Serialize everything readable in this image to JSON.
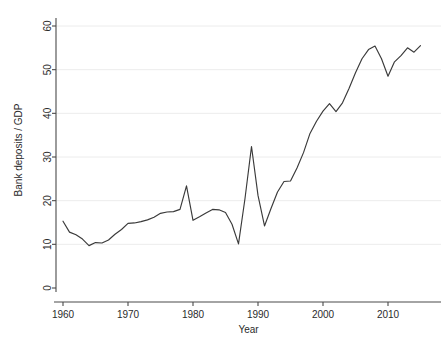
{
  "chart_data": {
    "type": "line",
    "title": "",
    "xlabel": "Year",
    "ylabel": "Bank deposits / GDP",
    "xlim": [
      1958.5,
      2016.5
    ],
    "ylim": [
      0,
      62
    ],
    "xticks": [
      1960,
      1970,
      1980,
      1990,
      2000,
      2010
    ],
    "yticks": [
      0,
      10,
      20,
      30,
      40,
      50,
      60
    ],
    "xticklabels": [
      "1960",
      "1970",
      "1980",
      "1990",
      "2000",
      "2010"
    ],
    "yticklabels": [
      "0",
      "10",
      "20",
      "30",
      "40",
      "50",
      "60"
    ],
    "grid": "horizontal",
    "legend": "none",
    "line_color": "#3a3a3a",
    "grid_color": "#ececec",
    "axis_color": "#4a4a4a",
    "series": [
      {
        "name": "Bank deposits / GDP",
        "x": [
          1960,
          1961,
          1962,
          1963,
          1964,
          1965,
          1966,
          1967,
          1968,
          1969,
          1970,
          1971,
          1972,
          1973,
          1974,
          1975,
          1976,
          1977,
          1978,
          1979,
          1980,
          1981,
          1982,
          1983,
          1984,
          1985,
          1986,
          1987,
          1988,
          1989,
          1990,
          1991,
          1992,
          1993,
          1994,
          1995,
          1996,
          1997,
          1998,
          1999,
          2000,
          2001,
          2002,
          2003,
          2004,
          2005,
          2006,
          2007,
          2008,
          2009,
          2010,
          2011,
          2012,
          2013,
          2014,
          2015
        ],
        "values": [
          15.3,
          12.8,
          12.2,
          11.2,
          9.7,
          10.4,
          10.3,
          11.0,
          12.3,
          13.4,
          14.8,
          14.9,
          15.2,
          15.6,
          16.2,
          17.1,
          17.4,
          17.5,
          18.0,
          23.4,
          15.5,
          16.3,
          17.2,
          18.0,
          17.9,
          17.3,
          14.6,
          10.1,
          20.5,
          32.4,
          21.2,
          14.2,
          18.2,
          22.0,
          24.4,
          24.5,
          27.5,
          31.0,
          35.4,
          38.2,
          40.5,
          42.2,
          40.4,
          42.4,
          45.7,
          49.3,
          52.5,
          54.6,
          55.4,
          52.5,
          48.5,
          51.8,
          53.2,
          55.0,
          54.0,
          55.5
        ]
      }
    ]
  },
  "axes": {
    "y_axis_title": "Bank deposits / GDP",
    "x_axis_title": "Year"
  }
}
